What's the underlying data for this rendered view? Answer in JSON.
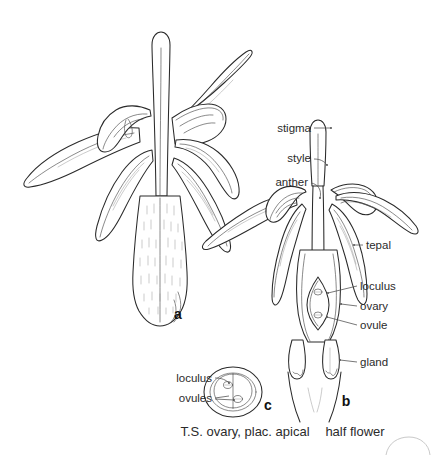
{
  "plate": {
    "background_color": "#ffffff",
    "ink_color": "#2a2a2a",
    "label_color": "#2b2b2b",
    "width": 442,
    "height": 455
  },
  "figures": [
    {
      "key": "a",
      "letter": "a",
      "name": "whole-flower",
      "caption": ""
    },
    {
      "key": "b",
      "letter": "b",
      "name": "half-flower",
      "caption": "half flower"
    },
    {
      "key": "c",
      "letter": "c",
      "name": "ts-ovary",
      "caption": "T.S. ovary, plac. apical"
    }
  ],
  "labels": {
    "half_flower_left": [
      {
        "id": "stigma",
        "text": "stigma"
      },
      {
        "id": "style",
        "text": "style"
      },
      {
        "id": "anther",
        "text": "anther"
      }
    ],
    "half_flower_right": [
      {
        "id": "tepal",
        "text": "tepal"
      },
      {
        "id": "loculus",
        "text": "loculus"
      },
      {
        "id": "ovary",
        "text": "ovary"
      },
      {
        "id": "ovule",
        "text": "ovule"
      },
      {
        "id": "gland",
        "text": "gland"
      }
    ],
    "ts_ovary": [
      {
        "id": "loculus",
        "text": "loculus"
      },
      {
        "id": "ovules",
        "text": "ovules"
      }
    ]
  },
  "captions": {
    "ts_ovary": "T.S. ovary, plac. apical",
    "half_flower": "half flower"
  },
  "figure_letters": {
    "a": "a",
    "b": "b",
    "c": "c"
  }
}
